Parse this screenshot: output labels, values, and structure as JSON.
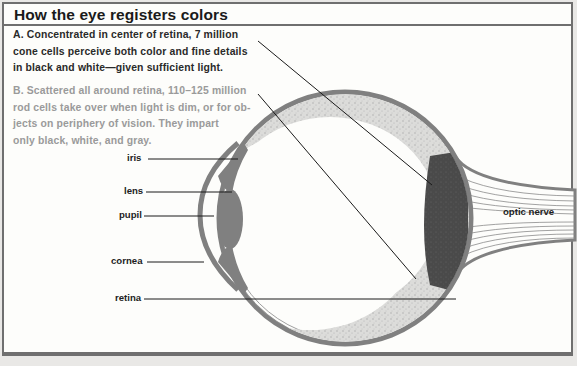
{
  "title": "How the eye registers colors",
  "paragraphs": {
    "a": {
      "lines": [
        "A. Concentrated in center of retina, 7 million",
        "cone cells perceive both color and fine details",
        "in black and white—given sufficient light."
      ]
    },
    "b": {
      "lines": [
        "B. Scattered all around retina, 110–125 million",
        "rod cells take over when light is dim, or for ob-",
        "jects on periphery of vision. They impart",
        "only black, white, and gray."
      ]
    }
  },
  "labels": {
    "iris": "iris",
    "lens": "lens",
    "pupil": "pupil",
    "cornea": "cornea",
    "retina": "retina",
    "optic_nerve": "optic nerve"
  },
  "colors": {
    "tissue_gray": "#808080",
    "cone_region": "#4a4a4a",
    "rod_region": "#d2d2d0",
    "text_a": "#2a2a2a",
    "text_b": "#9a9a9a"
  }
}
